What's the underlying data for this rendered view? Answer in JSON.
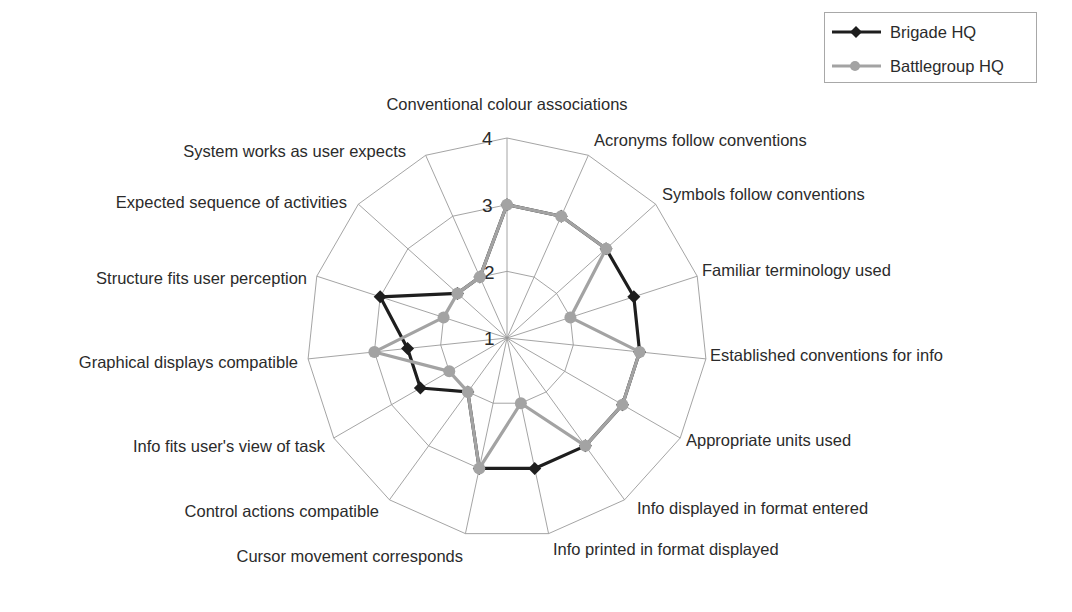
{
  "chart_data": {
    "type": "radar",
    "title": "",
    "categories": [
      "Conventional colour associations",
      "Acronyms follow conventions",
      "Symbols follow conventions",
      "Familiar terminology used",
      "Established conventions for info",
      "Appropriate units used",
      "Info displayed in format entered",
      "Info printed in format displayed",
      "Cursor movement corresponds",
      "Control actions compatible",
      "Info fits user's view of task",
      "Graphical displays compatible",
      "Structure fits user perception",
      "Expected sequence of activities",
      "System works as user expects"
    ],
    "series": [
      {
        "name": "Brigade HQ",
        "color": "#1e1e1e",
        "marker": "diamond",
        "values": [
          3,
          3,
          3,
          3,
          3,
          3,
          3,
          3,
          3,
          2,
          2.5,
          2.5,
          3,
          2,
          2
        ]
      },
      {
        "name": "Battlegroup HQ",
        "color": "#a3a3a3",
        "marker": "circle",
        "values": [
          3,
          3,
          3,
          2,
          3,
          3,
          3,
          2,
          3,
          2,
          2,
          3,
          2,
          2,
          2
        ]
      }
    ],
    "radial_axis": {
      "min": 1,
      "max": 4,
      "ticks": [
        "1",
        "2",
        "3",
        "4"
      ],
      "tick_values": [
        1,
        2,
        3,
        4
      ]
    },
    "grid": true,
    "legend_position": "top-right"
  },
  "legend": {
    "items": [
      {
        "label": "Brigade HQ"
      },
      {
        "label": "Battlegroup HQ"
      }
    ]
  }
}
